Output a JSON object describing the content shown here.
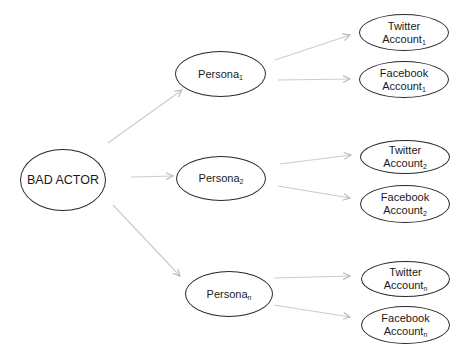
{
  "diagram": {
    "type": "tree",
    "edge_color": "#c8c8c8",
    "node_border_color": "#2a2a2a",
    "root": {
      "id": "bad-actor",
      "label": "BAD ACTOR"
    },
    "personas": [
      {
        "id": "persona-1",
        "label": "Persona",
        "sub": "1",
        "accounts": [
          {
            "id": "twitter-1",
            "line1": "Twitter",
            "line2": "Account",
            "sub": "1"
          },
          {
            "id": "facebook-1",
            "line1": "Facebook",
            "line2": "Account",
            "sub": "1"
          }
        ]
      },
      {
        "id": "persona-2",
        "label": "Persona",
        "sub": "2",
        "accounts": [
          {
            "id": "twitter-2",
            "line1": "Twitter",
            "line2": "Account",
            "sub": "2"
          },
          {
            "id": "facebook-2",
            "line1": "Facebook",
            "line2": "Account",
            "sub": "2"
          }
        ]
      },
      {
        "id": "persona-n",
        "label": "Persona",
        "sub": "n",
        "accounts": [
          {
            "id": "twitter-n",
            "line1": "Twitter",
            "line2": "Account",
            "sub": "n"
          },
          {
            "id": "facebook-n",
            "line1": "Facebook",
            "line2": "Account",
            "sub": "n"
          }
        ]
      }
    ],
    "edges": [
      [
        "bad-actor",
        "persona-1"
      ],
      [
        "bad-actor",
        "persona-2"
      ],
      [
        "bad-actor",
        "persona-n"
      ],
      [
        "persona-1",
        "twitter-1"
      ],
      [
        "persona-1",
        "facebook-1"
      ],
      [
        "persona-2",
        "twitter-2"
      ],
      [
        "persona-2",
        "facebook-2"
      ],
      [
        "persona-n",
        "twitter-n"
      ],
      [
        "persona-n",
        "facebook-n"
      ]
    ]
  }
}
